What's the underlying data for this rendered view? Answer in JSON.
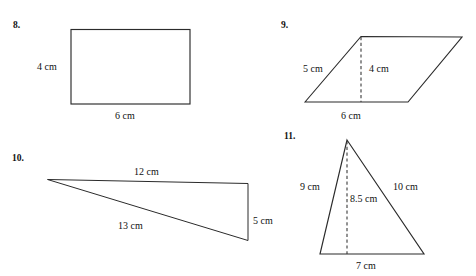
{
  "page": {
    "background_color": "#ffffff",
    "ink_color": "#2b2b2b",
    "width": 476,
    "height": 276
  },
  "problems": [
    {
      "id": "p8",
      "number": "8.",
      "shape": "rectangle",
      "labels": {
        "height": "4 cm",
        "width": "6 cm"
      }
    },
    {
      "id": "p9",
      "number": "9.",
      "shape": "parallelogram",
      "labels": {
        "side": "5 cm",
        "height": "4 cm",
        "base": "6 cm"
      }
    },
    {
      "id": "p10",
      "number": "10.",
      "shape": "right-triangle",
      "labels": {
        "top": "12 cm",
        "hypotenuse": "13 cm",
        "right_side": "5 cm"
      }
    },
    {
      "id": "p11",
      "number": "11.",
      "shape": "triangle",
      "labels": {
        "left_side": "9 cm",
        "height": "8.5 cm",
        "right_side": "10 cm",
        "base": "7 cm"
      }
    }
  ]
}
